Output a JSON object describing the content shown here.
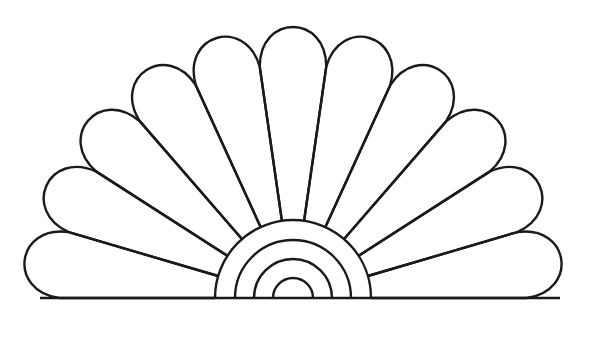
{
  "drawing": {
    "subject": "fan shell line art",
    "background": "#ffffff",
    "stroke": "#1a1a1a",
    "stroke_width": 2.4,
    "center": {
      "x": 293,
      "y": 298
    },
    "petals": {
      "count": 11,
      "inner_radius": 78,
      "outer_radius": 272,
      "tip_bulge": 1.0
    },
    "baseline": {
      "x1": 40,
      "x2": 560,
      "y": 298
    },
    "inner_arcs": [
      78,
      58,
      39,
      20
    ]
  }
}
